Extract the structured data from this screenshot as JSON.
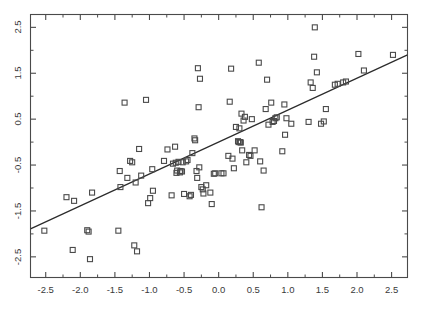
{
  "chart_data": {
    "type": "scatter",
    "title": "",
    "subtitle": "",
    "xlabel": "",
    "ylabel": "",
    "xlim": [
      -2.72,
      2.73
    ],
    "ylim": [
      -2.95,
      2.78
    ],
    "xticks": [
      -2.5,
      -2.0,
      -1.5,
      -1.0,
      -0.5,
      0.0,
      0.5,
      1.0,
      1.5,
      2.0,
      2.5
    ],
    "xticklabels": [
      "-2.5",
      "-2.0",
      "-1.5",
      "-1.0",
      "-0.5",
      "0.0",
      "0.5",
      "1.0",
      "1.5",
      "2.0",
      "2.5"
    ],
    "yticks": [
      -2.5,
      -1.5,
      -0.5,
      0.5,
      1.5,
      2.5
    ],
    "yticklabels": [
      "-2.5",
      "-1.5",
      "-0.5",
      "0.5",
      "1.5",
      "2.5"
    ],
    "minor_xticks": [
      -2.25,
      -1.75,
      -1.25,
      -0.75,
      -0.25,
      0.25,
      0.75,
      1.25,
      1.75,
      2.25
    ],
    "minor_yticks": [
      -2.0,
      -1.0,
      0.0,
      1.0,
      2.0
    ],
    "grid": false,
    "legend": null,
    "marker": "open-square",
    "marker_size_px": 5,
    "marker_color": "#4a4a4a",
    "line_color": "#2b2b2b",
    "frame_color": "#4a4a4a",
    "background_color": "#ffffff",
    "fit_line": {
      "type": "linear",
      "slope": 0.695,
      "intercept": 0.0,
      "x_start": -2.72,
      "y_start": -1.89,
      "x_end": 2.73,
      "y_end": 1.9
    },
    "points": [
      [
        -2.52,
        -1.93
      ],
      [
        -2.2,
        -1.2
      ],
      [
        -2.11,
        -2.35
      ],
      [
        -2.09,
        -1.28
      ],
      [
        -1.9,
        -1.92
      ],
      [
        -1.88,
        -1.95
      ],
      [
        -1.86,
        -2.55
      ],
      [
        -1.83,
        -1.1
      ],
      [
        -1.45,
        -1.93
      ],
      [
        -1.43,
        -0.63
      ],
      [
        -1.42,
        -0.98
      ],
      [
        -1.36,
        0.86
      ],
      [
        -1.32,
        -0.78
      ],
      [
        -1.28,
        -0.41
      ],
      [
        -1.25,
        -0.44
      ],
      [
        -1.22,
        -2.25
      ],
      [
        -1.2,
        -0.88
      ],
      [
        -1.18,
        -2.38
      ],
      [
        -1.15,
        -0.15
      ],
      [
        -1.12,
        -0.73
      ],
      [
        -1.05,
        0.92
      ],
      [
        -1.02,
        -1.33
      ],
      [
        -0.99,
        -1.22
      ],
      [
        -0.96,
        -0.59
      ],
      [
        -0.95,
        -1.06
      ],
      [
        -0.79,
        -0.41
      ],
      [
        -0.74,
        -0.16
      ],
      [
        -0.68,
        -1.16
      ],
      [
        -0.66,
        -0.47
      ],
      [
        -0.63,
        -0.1
      ],
      [
        -0.62,
        -0.45
      ],
      [
        -0.61,
        -0.67
      ],
      [
        -0.6,
        -0.62
      ],
      [
        -0.58,
        -0.43
      ],
      [
        -0.56,
        -0.66
      ],
      [
        -0.55,
        -0.63
      ],
      [
        -0.53,
        -0.64
      ],
      [
        -0.52,
        -0.44
      ],
      [
        -0.5,
        -1.13
      ],
      [
        -0.47,
        -0.42
      ],
      [
        -0.45,
        -0.39
      ],
      [
        -0.42,
        -1.18
      ],
      [
        -0.4,
        -1.15
      ],
      [
        -0.38,
        -0.24
      ],
      [
        -0.35,
        0.08
      ],
      [
        -0.34,
        0.04
      ],
      [
        -0.32,
        -0.63
      ],
      [
        -0.31,
        -0.78
      ],
      [
        -0.3,
        1.61
      ],
      [
        -0.29,
        0.76
      ],
      [
        -0.28,
        -0.55
      ],
      [
        -0.27,
        1.38
      ],
      [
        -0.25,
        -0.98
      ],
      [
        -0.23,
        -1.03
      ],
      [
        -0.22,
        -1.12
      ],
      [
        -0.18,
        -0.94
      ],
      [
        -0.12,
        -1.1
      ],
      [
        -0.1,
        -1.35
      ],
      [
        -0.07,
        -0.69
      ],
      [
        -0.05,
        -0.68
      ],
      [
        0.04,
        -0.68
      ],
      [
        0.07,
        -0.68
      ],
      [
        0.14,
        -0.3
      ],
      [
        0.16,
        0.88
      ],
      [
        0.18,
        1.6
      ],
      [
        0.2,
        -0.36
      ],
      [
        0.22,
        -0.57
      ],
      [
        0.25,
        0.33
      ],
      [
        0.28,
        0.02
      ],
      [
        0.29,
        0.0
      ],
      [
        0.3,
        0.3
      ],
      [
        0.31,
        0.0
      ],
      [
        0.32,
        -0.01
      ],
      [
        0.33,
        0.62
      ],
      [
        0.34,
        -0.18
      ],
      [
        0.36,
        0.47
      ],
      [
        0.38,
        0.55
      ],
      [
        0.4,
        -0.44
      ],
      [
        0.44,
        -0.28
      ],
      [
        0.46,
        -0.3
      ],
      [
        0.48,
        0.5
      ],
      [
        0.52,
        -0.18
      ],
      [
        0.58,
        1.73
      ],
      [
        0.6,
        -0.42
      ],
      [
        0.62,
        -1.42
      ],
      [
        0.65,
        -0.62
      ],
      [
        0.68,
        0.72
      ],
      [
        0.7,
        1.36
      ],
      [
        0.72,
        0.38
      ],
      [
        0.76,
        0.86
      ],
      [
        0.78,
        0.44
      ],
      [
        0.8,
        0.46
      ],
      [
        0.82,
        0.52
      ],
      [
        0.84,
        0.54
      ],
      [
        0.92,
        -0.2
      ],
      [
        0.95,
        0.82
      ],
      [
        0.96,
        0.16
      ],
      [
        0.98,
        0.52
      ],
      [
        1.05,
        0.4
      ],
      [
        1.3,
        0.44
      ],
      [
        1.33,
        1.3
      ],
      [
        1.36,
        1.18
      ],
      [
        1.38,
        1.86
      ],
      [
        1.39,
        2.5
      ],
      [
        1.42,
        1.52
      ],
      [
        1.48,
        0.4
      ],
      [
        1.52,
        0.45
      ],
      [
        1.55,
        0.72
      ],
      [
        1.68,
        1.25
      ],
      [
        1.72,
        1.27
      ],
      [
        1.8,
        1.3
      ],
      [
        1.84,
        1.32
      ],
      [
        2.02,
        1.92
      ],
      [
        2.1,
        1.56
      ],
      [
        2.52,
        1.9
      ]
    ]
  }
}
